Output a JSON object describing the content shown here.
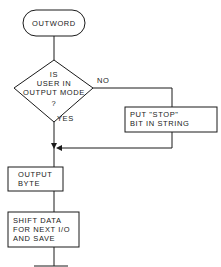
{
  "flowchart": {
    "start": {
      "label": "OUTWORD"
    },
    "decision": {
      "lines": [
        "IS",
        "USER IN",
        "OUTPUT MODE",
        "?"
      ],
      "no_label": "NO",
      "yes_label": "YES"
    },
    "no_branch": {
      "lines": [
        "PUT \"STOP\"",
        "BIT IN STRING"
      ]
    },
    "step1": {
      "lines": [
        "OUTPUT",
        "BYTE"
      ]
    },
    "step2": {
      "lines": [
        "SHIFT DATA",
        "FOR NEXT I/O",
        "AND SAVE"
      ]
    }
  },
  "colors": {
    "stroke": "#1a1a1a",
    "background": "#ffffff"
  }
}
